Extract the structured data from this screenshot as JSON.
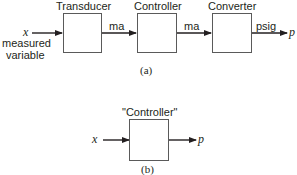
{
  "diagram_a": {
    "caption": "(a)",
    "input_symbol": "x",
    "input_label_line1": "measured",
    "input_label_line2": "variable",
    "blocks": [
      {
        "label": "Transducer"
      },
      {
        "label": "Controller"
      },
      {
        "label": "Converter"
      }
    ],
    "signals": [
      {
        "label": "ma"
      },
      {
        "label": "ma"
      },
      {
        "label": "psig"
      }
    ],
    "output_symbol": "p"
  },
  "diagram_b": {
    "caption": "(b)",
    "input_symbol": "x",
    "block": {
      "label": "\"Controller\""
    },
    "output_symbol": "p"
  }
}
